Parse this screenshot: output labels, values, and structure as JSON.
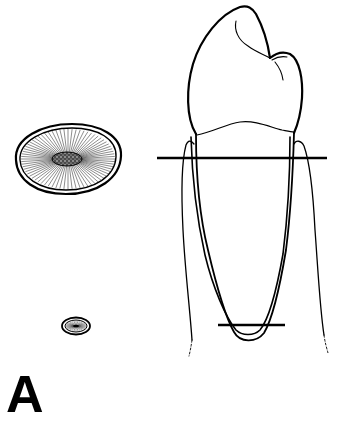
{
  "figure": {
    "panel_label": "A",
    "colors": {
      "stroke": "#000000",
      "background": "#ffffff",
      "pulp_fill": "#3a3a3a"
    },
    "elements": {
      "tooth": "tooth-longitudinal-section",
      "cross_section_cervical": "root-cross-section-cervical-level",
      "cross_section_apical": "root-cross-section-apical-level",
      "cut_line_cervical": "horizontal-section-line-cervical",
      "cut_line_apical": "horizontal-section-line-apical"
    }
  }
}
